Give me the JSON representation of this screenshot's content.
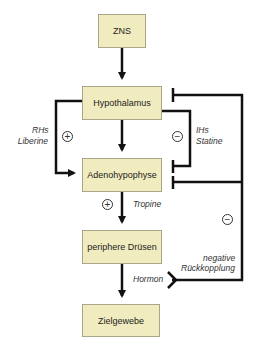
{
  "nodes": {
    "zns": "ZNS",
    "hypothalamus": "Hypothalamus",
    "adenohypophyse": "Adenohypophyse",
    "periphere_druesen": "periphere Drüsen",
    "zielgewebe": "Zielgewebe"
  },
  "labels": {
    "rhs": "RHs",
    "liberine": "Liberine",
    "ihs": "IHs",
    "statine": "Statine",
    "tropine": "Tropine",
    "hormon": "Hormon",
    "negative": "negative",
    "rueckkopplung": "Rückkopplung"
  },
  "signs": {
    "plus_liberine": "+",
    "minus_statine": "−",
    "plus_tropine": "+",
    "minus_feedback": "−"
  },
  "colors": {
    "box_fill": "#f1ecbf",
    "line": "#111111"
  }
}
